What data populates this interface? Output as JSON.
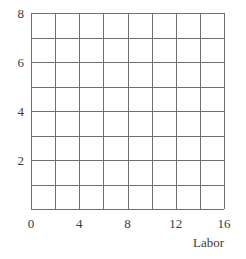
{
  "chart_data": {
    "type": "grid",
    "title": "",
    "subtitle": "",
    "xlabel": "Labor",
    "ylabel": "",
    "xlim": [
      0,
      16
    ],
    "ylim": [
      0,
      8
    ],
    "x_tick_labels": [
      "0",
      "4",
      "8",
      "12",
      "16"
    ],
    "x_tick_values": [
      0,
      4,
      8,
      12,
      16
    ],
    "y_tick_labels": [
      "2",
      "4",
      "6",
      "8"
    ],
    "y_tick_values": [
      2,
      4,
      6,
      8
    ],
    "y_origin_label": "0",
    "grid": true,
    "grid_x_step": 2,
    "grid_y_step": 1,
    "grid_columns": 8,
    "grid_rows": 8,
    "legend": [],
    "series": [],
    "annotations": [],
    "colors": {
      "grid_line": "#707070",
      "axis_line": "#707070",
      "label_text": "#3a3a3a",
      "background": "#ffffff"
    }
  },
  "plot": {
    "left_px": 31,
    "top_px": 13,
    "right_px": 224,
    "bottom_px": 209
  }
}
